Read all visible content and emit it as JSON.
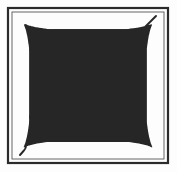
{
  "figure": {
    "caption": "",
    "width": 177,
    "height": 172,
    "background_color": "#fdfdfd"
  },
  "frame": {
    "name": "double-square-border",
    "outer": {
      "x": 8,
      "y": 8,
      "width": 160,
      "height": 155,
      "stroke_color": "#2b2b2b",
      "stroke_width": 2.2
    },
    "inner": {
      "x": 12,
      "y": 12,
      "width": 152,
      "height": 147,
      "stroke_color": "#555555",
      "stroke_width": 0.9
    }
  },
  "pattern": {
    "name": "woven-diagonal-lattice",
    "stroke_color": "#262626",
    "stroke_width": 1.9,
    "fill": "none",
    "line_cap": "round",
    "diagonal_spacing": 34,
    "loops_per_edge": {
      "top": 4,
      "right": 4,
      "bottom": 4,
      "left": 4
    },
    "loose_ends": [
      {
        "name": "tail-top-right",
        "x": 156,
        "y": 16
      },
      {
        "name": "tail-bottom-left",
        "x": 20,
        "y": 155
      }
    ],
    "interior_region": {
      "x": 16,
      "y": 16,
      "width": 144,
      "height": 139
    }
  },
  "geometry": {
    "cell": 34,
    "turn_radius": 17,
    "inset": 16,
    "comment": "Single strand travelling at 45 degrees, reflecting off all four sides with semicircular U-turns."
  }
}
